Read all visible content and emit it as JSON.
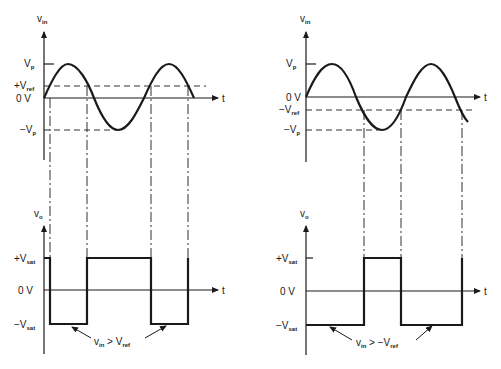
{
  "left": {
    "input_axis_label": "v",
    "input_axis_sub": "in",
    "vp_label": "V",
    "vp_sub": "p",
    "vref_label": "+V",
    "vref_sub": "ref",
    "zero_label": "0 V",
    "neg_vp_label": "−V",
    "neg_vp_sub": "p",
    "t_label": "t",
    "output_axis_label": "v",
    "output_axis_sub": "o",
    "pos_sat_label": "+V",
    "pos_sat_sub": "sat",
    "out_zero_label": "0 V",
    "neg_sat_label": "−V",
    "neg_sat_sub": "sat",
    "out_t_label": "t",
    "annotation_v": "v",
    "annotation_v_sub": "in",
    "annotation_op": " > V",
    "annotation_ref_sub": "ref"
  },
  "right": {
    "input_axis_label": "v",
    "input_axis_sub": "in",
    "vp_label": "V",
    "vp_sub": "p",
    "zero_label": "0 V",
    "vref_label": "−V",
    "vref_sub": "ref",
    "neg_vp_label": "−V",
    "neg_vp_sub": "p",
    "t_label": "t",
    "output_axis_label": "v",
    "output_axis_sub": "o",
    "pos_sat_label": "+V",
    "pos_sat_sub": "sat",
    "out_zero_label": "0 V",
    "neg_sat_label": "−V",
    "neg_sat_sub": "sat",
    "out_t_label": "t",
    "annotation_v": "v",
    "annotation_v_sub": "in",
    "annotation_op": " > −V",
    "annotation_ref_sub": "ref"
  }
}
